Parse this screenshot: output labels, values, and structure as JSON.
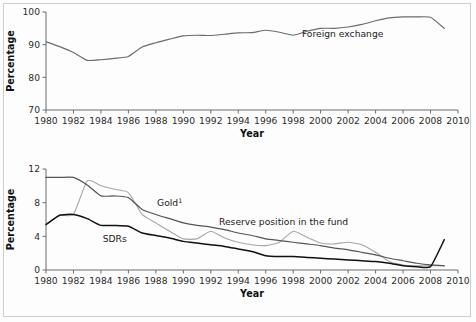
{
  "figure": {
    "background": "#ffffff",
    "border_color": "#cfcfcf"
  },
  "chart_data": [
    {
      "id": "top-panel",
      "type": "line",
      "title": "",
      "xlabel": "Year",
      "ylabel": "Percentage",
      "xlim": [
        1980,
        2010
      ],
      "ylim": [
        70,
        100
      ],
      "xticks": [
        1980,
        1982,
        1984,
        1986,
        1988,
        1990,
        1992,
        1994,
        1996,
        1998,
        2000,
        2002,
        2004,
        2006,
        2008,
        2010
      ],
      "xticklabels": [
        "1980",
        "1982",
        "1984",
        "1986",
        "1988",
        "1990",
        "1992",
        "1994",
        "1996",
        "1998",
        "2000",
        "2002",
        "2004",
        "2006",
        "2008",
        "2010"
      ],
      "yticks": [
        70,
        80,
        90,
        100
      ],
      "yticklabels": [
        "70",
        "80",
        "90",
        "100"
      ],
      "grid": false,
      "legend_position": "inline-annotation",
      "series": [
        {
          "name": "Foreign exchange",
          "label": "Foreign exchange",
          "color": "#6b6b6b",
          "width": 1.1,
          "label_x": 2001.6,
          "label_y": 92.2,
          "x": [
            1980,
            1981,
            1982,
            1983,
            1984,
            1985,
            1986,
            1987,
            1988,
            1989,
            1990,
            1991,
            1992,
            1993,
            1994,
            1995,
            1996,
            1997,
            1998,
            1999,
            2000,
            2001,
            2002,
            2003,
            2004,
            2005,
            2006,
            2007,
            2008,
            2009
          ],
          "y": [
            90.9,
            89.4,
            87.6,
            85.2,
            85.4,
            85.8,
            86.4,
            89.3,
            90.6,
            91.7,
            92.7,
            92.9,
            92.8,
            93.2,
            93.6,
            93.7,
            94.4,
            93.8,
            92.9,
            94.1,
            95.0,
            95.0,
            95.4,
            96.2,
            97.3,
            98.2,
            98.5,
            98.5,
            98.4,
            95.0
          ]
        }
      ]
    },
    {
      "id": "bottom-panel",
      "type": "line",
      "title": "",
      "xlabel": "Year",
      "ylabel": "Percentage",
      "xlim": [
        1980,
        2010
      ],
      "ylim": [
        0,
        12
      ],
      "xticks": [
        1980,
        1982,
        1984,
        1986,
        1988,
        1990,
        1992,
        1994,
        1996,
        1998,
        2000,
        2002,
        2004,
        2006,
        2008,
        2010
      ],
      "xticklabels": [
        "1980",
        "1982",
        "1984",
        "1986",
        "1988",
        "1990",
        "1992",
        "1994",
        "1996",
        "1998",
        "2000",
        "2002",
        "2004",
        "2006",
        "2008",
        "2010"
      ],
      "yticks": [
        0,
        4,
        8,
        12
      ],
      "yticklabels": [
        "0",
        "4",
        "8",
        "12"
      ],
      "grid": false,
      "legend_position": "inline-annotation",
      "footnote_marker": "1",
      "series": [
        {
          "name": "Gold",
          "label": "Gold",
          "superscript": "1",
          "color": "#a6a6a6",
          "width": 1.1,
          "label_x": 1989.0,
          "label_y": 7.6,
          "x": [
            1980,
            1981,
            1982,
            1983,
            1984,
            1985,
            1986,
            1987,
            1988,
            1989,
            1990,
            1991,
            1992,
            1993,
            1994,
            1995,
            1996,
            1997,
            1998,
            1999,
            2000,
            2001,
            2002,
            2003,
            2004,
            2005,
            2006,
            2007,
            2008,
            2009
          ],
          "y": [
            5.4,
            6.5,
            6.6,
            10.6,
            10.0,
            9.6,
            9.2,
            6.6,
            5.6,
            4.6,
            3.7,
            3.7,
            4.6,
            3.8,
            3.3,
            3.0,
            2.9,
            3.3,
            4.6,
            3.9,
            3.2,
            3.1,
            3.3,
            3.0,
            2.1,
            1.0,
            0.6,
            0.5,
            0.5,
            0.5
          ]
        },
        {
          "name": "Reserve position in the fund",
          "label": "Reserve position in the fund",
          "color": "#555555",
          "width": 1.2,
          "label_x": 1997.3,
          "label_y": 5.4,
          "x": [
            1980,
            1981,
            1982,
            1983,
            1984,
            1985,
            1986,
            1987,
            1988,
            1989,
            1990,
            1991,
            1992,
            1993,
            1994,
            1995,
            1996,
            1997,
            1998,
            1999,
            2000,
            2001,
            2002,
            2003,
            2004,
            2005,
            2006,
            2007,
            2008,
            2009
          ],
          "y": [
            11.0,
            11.0,
            11.0,
            10.1,
            8.8,
            8.8,
            8.6,
            7.2,
            6.6,
            6.1,
            5.6,
            5.3,
            5.1,
            4.8,
            4.4,
            4.1,
            3.7,
            3.5,
            3.3,
            3.1,
            2.9,
            2.6,
            2.4,
            2.1,
            1.8,
            1.4,
            1.1,
            0.8,
            0.6,
            0.5
          ]
        },
        {
          "name": "SDRs",
          "label": "SDRs",
          "color": "#111111",
          "width": 1.5,
          "label_x": 1985.0,
          "label_y": 3.3,
          "x": [
            1980,
            1981,
            1982,
            1983,
            1984,
            1985,
            1986,
            1987,
            1988,
            1989,
            1990,
            1991,
            1992,
            1993,
            1994,
            1995,
            1996,
            1997,
            1998,
            1999,
            2000,
            2001,
            2002,
            2003,
            2004,
            2005,
            2006,
            2007,
            2008,
            2009
          ],
          "y": [
            5.4,
            6.5,
            6.6,
            6.1,
            5.3,
            5.3,
            5.2,
            4.4,
            4.1,
            3.8,
            3.4,
            3.2,
            3.0,
            2.8,
            2.5,
            2.2,
            1.7,
            1.6,
            1.6,
            1.5,
            1.4,
            1.3,
            1.2,
            1.1,
            1.0,
            0.8,
            0.5,
            0.4,
            0.4,
            3.6
          ]
        }
      ]
    }
  ]
}
